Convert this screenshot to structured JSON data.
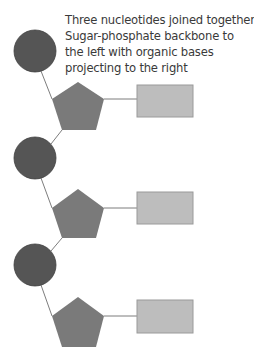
{
  "caption": {
    "lines": [
      "Three nucleotides joined together.",
      "Sugar-phosphate backbone to",
      "the left with organic bases",
      "projecting to the right"
    ]
  },
  "colors": {
    "phosphate": "#555555",
    "sugar": "#7a7a7a",
    "base": "#bdbdbd",
    "base_stroke": "#9a9a9a",
    "bond": "#7d7d7d"
  },
  "nucleotides": [
    {
      "phosphate": {
        "cx": 35,
        "cy": 51,
        "r": 21
      },
      "sugar": {
        "points": "78,82 104,99 96,130 62,130 52,99"
      },
      "base": {
        "x": 137,
        "y": 85,
        "w": 56,
        "h": 32
      }
    },
    {
      "phosphate": {
        "cx": 35,
        "cy": 158,
        "r": 21
      },
      "sugar": {
        "points": "78,189 104,208 96,238 62,238 52,208"
      },
      "base": {
        "x": 137,
        "y": 192,
        "w": 56,
        "h": 32
      }
    },
    {
      "phosphate": {
        "cx": 35,
        "cy": 265,
        "r": 21
      },
      "sugar": {
        "points": "78,297 104,316 96,347 62,347 52,316"
      },
      "base": {
        "x": 137,
        "y": 300,
        "w": 56,
        "h": 33
      }
    }
  ]
}
